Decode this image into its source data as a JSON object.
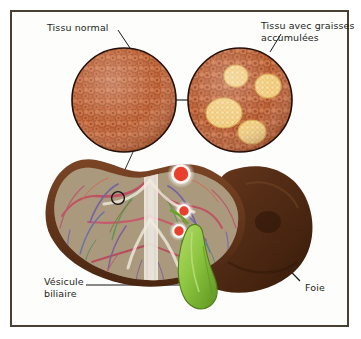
{
  "figure": {
    "language": "fr",
    "frame_color": "#4a4032",
    "background_color": "#fdfdfb"
  },
  "labels": {
    "normal_tissue": "Tissu normal",
    "fatty_tissue": "Tissu avec graisses\naccumulées",
    "gallbladder": "Vésicule\nbiliaire",
    "liver": "Foie"
  },
  "colors": {
    "text": "#231f1c",
    "leader_line": "#1a1a1a",
    "hepatocyte": "#c4693f",
    "hepatocyte_dark": "#a34f2c",
    "fat_deposit": "#f3cf80",
    "fat_deposit_edge": "#d9a84e",
    "liver_surface": "#4d2a16",
    "liver_surface_light": "#7a4524",
    "gallbladder": "#8cc63f",
    "vessel_red": "#e03a2a",
    "vessel_blue": "#5b8fd0"
  },
  "panels": {
    "normal_circle": {
      "name": "normal-liver-tissue",
      "cx": 124,
      "cy": 100,
      "r": 52,
      "fat_deposits": 0,
      "description": "Hépatocytes serrés, aucune vacuole lipidique"
    },
    "fatty_circle": {
      "name": "fatty-liver-tissue",
      "cx": 240,
      "cy": 100,
      "r": 52,
      "fat_deposits": 4,
      "description": "Hépatocytes avec vacuoles de graisse jaunes"
    }
  },
  "anatomy": {
    "liver_lobes": [
      "lobe gauche (coupe)",
      "lobe droit (surface)"
    ],
    "vessels": [
      "veine hépatique",
      "veine porte",
      "artère hépatique"
    ],
    "organ": "vésicule biliaire"
  }
}
